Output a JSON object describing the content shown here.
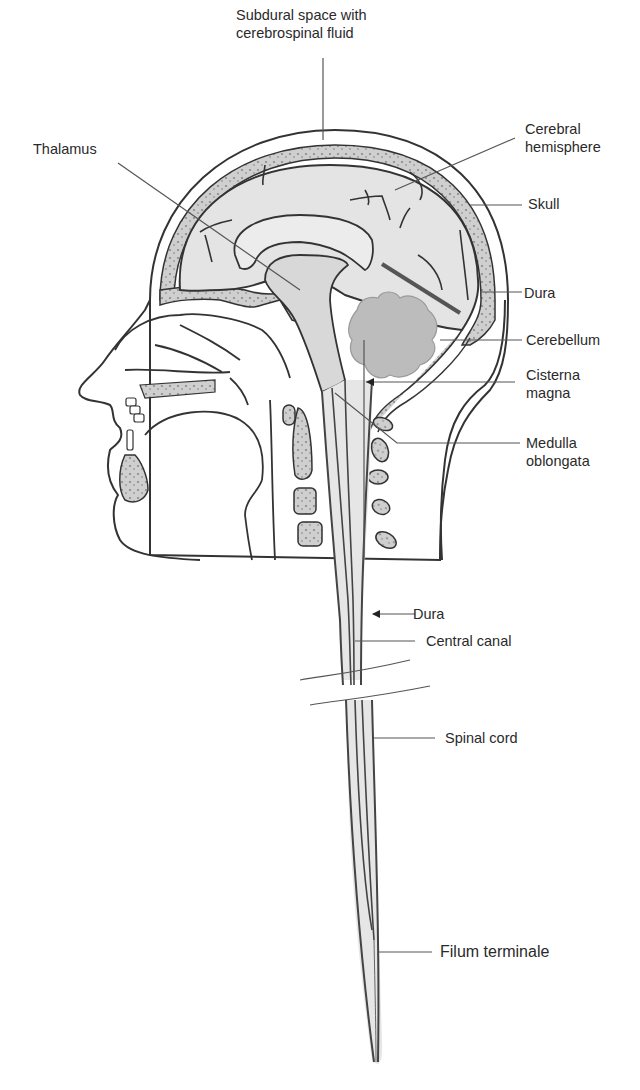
{
  "colors": {
    "background": "#ffffff",
    "outline": "#333333",
    "tissue_fill": "#e6e6e6",
    "brain_fill": "#e2e2e2",
    "bone_fill": "#c9c9c9",
    "cerebellum_fill": "#bdbdbd",
    "leader_line": "#555555",
    "label_text": "#2a2a2a"
  },
  "labels": {
    "subdural": "Subdural space with\ncerebrospinal fluid",
    "thalamus": "Thalamus",
    "cerebral_hemisphere": "Cerebral\nhemisphere",
    "skull": "Skull",
    "dura_upper": "Dura",
    "cerebellum": "Cerebellum",
    "cisterna_magna": "Cisterna\nmagna",
    "medulla_oblongata": "Medulla\noblongata",
    "dura_lower": "Dura",
    "central_canal": "Central canal",
    "spinal_cord": "Spinal cord",
    "filum_terminale": "Filum terminale"
  }
}
